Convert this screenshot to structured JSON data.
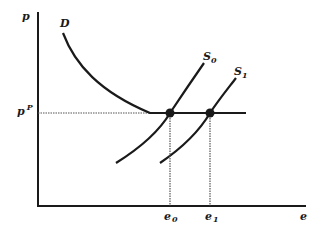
{
  "diagram": {
    "type": "supply-demand",
    "axes": {
      "y_label": "p",
      "x_label": "e"
    },
    "price_level": {
      "label_base": "p",
      "label_sup": "P"
    },
    "curves": [
      {
        "id": "D",
        "label_base": "D",
        "label_sub": ""
      },
      {
        "id": "S0",
        "label_base": "S",
        "label_sub": "0"
      },
      {
        "id": "S1",
        "label_base": "S",
        "label_sub": "1"
      }
    ],
    "equilibria": [
      {
        "id": "e0",
        "label_base": "e",
        "label_sub": "0"
      },
      {
        "id": "e1",
        "label_base": "e",
        "label_sub": "1"
      }
    ],
    "colors": {
      "ink": "#1a1a1a",
      "guide": "#555555"
    }
  }
}
